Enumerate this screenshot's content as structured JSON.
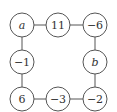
{
  "diagram": {
    "type": "cycle-graph",
    "nodes": [
      {
        "id": "n0",
        "label": "a",
        "is_variable": true,
        "cx": 22,
        "cy": 25
      },
      {
        "id": "n1",
        "label": "11",
        "is_variable": false,
        "cx": 58,
        "cy": 25
      },
      {
        "id": "n2",
        "label": "−6",
        "is_variable": false,
        "cx": 95,
        "cy": 25
      },
      {
        "id": "n3",
        "label": "b",
        "is_variable": true,
        "cx": 95,
        "cy": 62
      },
      {
        "id": "n4",
        "label": "−2",
        "is_variable": false,
        "cx": 95,
        "cy": 99
      },
      {
        "id": "n5",
        "label": "−3",
        "is_variable": false,
        "cx": 58,
        "cy": 99
      },
      {
        "id": "n6",
        "label": "6",
        "is_variable": false,
        "cx": 22,
        "cy": 99
      },
      {
        "id": "n7",
        "label": "−1",
        "is_variable": false,
        "cx": 22,
        "cy": 62
      }
    ],
    "edges": [
      [
        "n0",
        "n1"
      ],
      [
        "n1",
        "n2"
      ],
      [
        "n2",
        "n3"
      ],
      [
        "n3",
        "n4"
      ],
      [
        "n4",
        "n5"
      ],
      [
        "n5",
        "n6"
      ],
      [
        "n6",
        "n7"
      ],
      [
        "n7",
        "n0"
      ]
    ],
    "node_radius": 12,
    "colors": {
      "stroke": "#555555",
      "text": "#333333",
      "background": "#ffffff"
    }
  }
}
